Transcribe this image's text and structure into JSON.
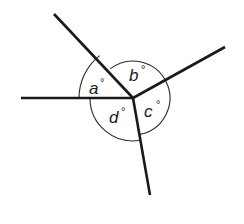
{
  "diagram": {
    "type": "angles-around-a-point",
    "center": {
      "x": 133,
      "y": 98
    },
    "rays": [
      {
        "id": "upper-left",
        "x": 54,
        "y": 14
      },
      {
        "id": "upper-right",
        "x": 225,
        "y": 47
      },
      {
        "id": "left",
        "x": 21,
        "y": 98
      },
      {
        "id": "bottom",
        "x": 150,
        "y": 195
      }
    ],
    "angles": [
      {
        "id": "a",
        "label": "a",
        "unit": "°",
        "between": [
          "left",
          "upper-left"
        ]
      },
      {
        "id": "b",
        "label": "b",
        "unit": "°",
        "between": [
          "upper-left",
          "upper-right"
        ]
      },
      {
        "id": "c",
        "label": "c",
        "unit": "°",
        "between": [
          "upper-right",
          "bottom"
        ]
      },
      {
        "id": "d",
        "label": "d",
        "unit": "°",
        "between": [
          "bottom",
          "left"
        ]
      }
    ],
    "colors": {
      "line": "#1a1a1a",
      "background": "#ffffff"
    }
  }
}
